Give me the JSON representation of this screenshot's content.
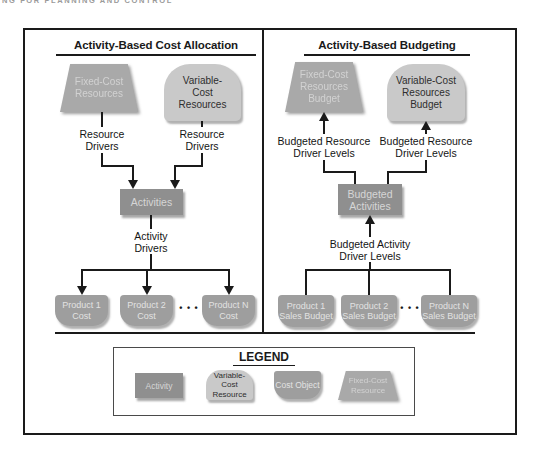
{
  "running_header": "NG FOR PLANNING AND CONTROL",
  "left_panel": {
    "title": "Activity-Based Cost Allocation",
    "fixed_cost_resources": "Fixed-Cost\nResources",
    "variable_cost_resources": "Variable-\nCost\nResources",
    "resource_drivers_left": "Resource\nDrivers",
    "resource_drivers_right": "Resource\nDrivers",
    "activities": "Activities",
    "activity_drivers": "Activity\nDrivers",
    "products": [
      "Product 1\nCost",
      "Product 2\nCost",
      "Product N\nCost"
    ],
    "ellipsis": "• • •"
  },
  "right_panel": {
    "title": "Activity-Based Budgeting",
    "fixed_cost_resources_budget": "Fixed-Cost\nResources\nBudget",
    "variable_cost_resources_budget": "Variable-Cost\nResources\nBudget",
    "budgeted_resource_driver_levels_left": "Budgeted Resource\nDriver Levels",
    "budgeted_resource_driver_levels_right": "Budgeted Resource\nDriver Levels",
    "budgeted_activities": "Budgeted\nActivities",
    "budgeted_activity_driver_levels": "Budgeted Activity\nDriver Levels",
    "products": [
      "Product 1\nSales Budget",
      "Product 2\nSales Budget",
      "Product N\nSales Budget"
    ],
    "ellipsis": "• • •"
  },
  "legend": {
    "title": "LEGEND",
    "items": [
      {
        "label": "Activity",
        "shape": "activity"
      },
      {
        "label": "Variable-Cost\nResource",
        "shape": "variable-cost-resource"
      },
      {
        "label": "Cost Object",
        "shape": "cost-object"
      },
      {
        "label": "Fixed-Cost\nResource",
        "shape": "fixed-cost-resource"
      }
    ]
  },
  "colors": {
    "activity_fill": "#8f8f8f",
    "activity_text": "#d6d6d6",
    "fixed_fill": "#a9a9a9",
    "fixed_text": "#d2d2d2",
    "variable_fill": "#c9c9c9",
    "variable_text": "#2e2e2e",
    "cost_fill": "#9e9e9e",
    "cost_text": "#e2e2e2",
    "line": "#1a1a1a"
  }
}
